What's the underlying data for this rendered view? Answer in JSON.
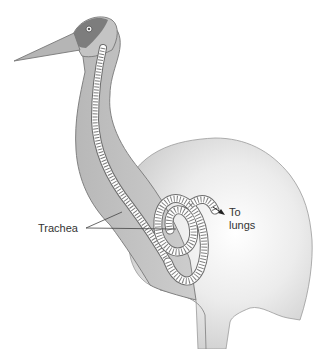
{
  "diagram": {
    "labels": {
      "trachea": "Trachea",
      "to_lungs_line1": "To",
      "to_lungs_line2": "lungs"
    },
    "colors": {
      "body_fill": "#d4d4d4",
      "neck_fill": "#bdbdbd",
      "head_patch": "#7a7a7a",
      "outline": "#6a6a6a",
      "trachea_fill": "#ffffff",
      "leader_line": "#444444"
    }
  }
}
